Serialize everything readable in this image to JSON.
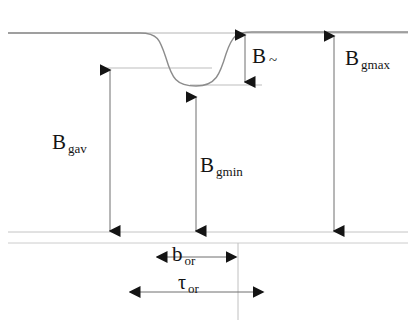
{
  "figure": {
    "type": "engineering-dimension-diagram",
    "background_color": "#ffffff",
    "line_color": "#9a9a9a",
    "curve_color": "#8c8c8c",
    "arrow_color": "#141414",
    "text_color": "#141414"
  },
  "labels": {
    "b_tilde": {
      "base": "B",
      "sub": "~",
      "x": 252,
      "y": 46
    },
    "b_gmax": {
      "base": "B",
      "sub": "gmax",
      "x": 345,
      "y": 48
    },
    "b_gav": {
      "base": "B",
      "sub": "gav",
      "x": 52,
      "y": 132
    },
    "b_gmin": {
      "base": "B",
      "sub": "gmin",
      "x": 200,
      "y": 155
    },
    "b_or": {
      "base": "b",
      "sub": "or",
      "x": 172,
      "y": 244
    },
    "tau_or": {
      "base": "τ",
      "sub": "or",
      "x": 178,
      "y": 272
    }
  },
  "dimensions": {
    "vertical": [
      {
        "name": "b-tilde-dimension",
        "x": 245,
        "y_top": 33,
        "y_bottom": 84
      },
      {
        "name": "b-gmax-dimension",
        "x": 334,
        "y_top": 34,
        "y_bottom": 233
      },
      {
        "name": "b-gav-dimension",
        "x": 110,
        "y_top": 68,
        "y_bottom": 233
      },
      {
        "name": "b-gmin-dimension",
        "x": 196,
        "y_top": 95,
        "y_bottom": 233
      }
    ],
    "horizontal": [
      {
        "name": "b-or-dimension",
        "y": 257,
        "x_left": 155,
        "x_right": 238
      },
      {
        "name": "tau-or-dimension",
        "y": 292,
        "x_left": 128,
        "x_right": 265
      }
    ]
  },
  "reference_lines": {
    "top_stator_line": {
      "y": 33,
      "x_left": 8,
      "x_right": 408
    },
    "b_gav_level_line": {
      "y": 68,
      "x_left": 104,
      "x_right": 212
    },
    "b_gmin_level_line": {
      "y": 85,
      "x_left": 190,
      "x_right": 262
    },
    "bottom_line_upper": {
      "y": 232,
      "x_left": 8,
      "x_right": 408
    },
    "bottom_line_lower": {
      "y": 243,
      "x_left": 8,
      "x_right": 408
    },
    "slot_edge_vertical": {
      "x": 238,
      "y_top": 243,
      "y_bottom": 320
    }
  },
  "curve": {
    "name": "flux-density-profile",
    "flat_level_y": 33,
    "dip_bottom_y": 86,
    "dip_left_x": 150,
    "dip_right_x": 240,
    "start_x": 8,
    "end_x": 408
  }
}
